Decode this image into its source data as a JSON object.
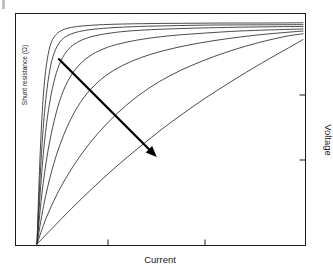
{
  "chart_data": {
    "type": "line",
    "title": "",
    "subtitle": "",
    "xlabel": "Current",
    "ylabel": "Voltage",
    "ylabel_secondary": "Shunt resistance (Ω)",
    "xlabel_position": "bottom-center",
    "ylabel_position": "right-rotated",
    "ylabel_secondary_position": "left-inside-rotated",
    "grid": false,
    "legend": false,
    "legend_position": "none",
    "xlim": [
      0,
      1
    ],
    "ylim": [
      0,
      1
    ],
    "x_tick_labels": [],
    "y_tick_labels": [],
    "x_tick_positions": [
      0.32,
      0.63
    ],
    "y_tick_positions": [
      0.35,
      0.65
    ],
    "series_count": 7,
    "series_description": "Family of current-voltage curves with decreasing shunt resistance; all curves share a common origin and saturate toward the upper right.",
    "annotation": {
      "type": "arrow",
      "label": "",
      "meaning": "decreasing shunt resistance",
      "from": [
        0.08,
        0.81
      ],
      "to": [
        0.45,
        0.38
      ]
    },
    "series": [
      {
        "name": "Rsh 1 (highest)",
        "knee_x": 0.055,
        "plateau_y": 0.965,
        "points": [
          [
            0.0,
            0.0
          ],
          [
            0.01,
            0.34
          ],
          [
            0.02,
            0.58
          ],
          [
            0.03,
            0.73
          ],
          [
            0.042,
            0.828
          ],
          [
            0.055,
            0.884
          ],
          [
            0.072,
            0.915
          ],
          [
            0.095,
            0.934
          ],
          [
            0.13,
            0.946
          ],
          [
            0.18,
            0.953
          ],
          [
            0.25,
            0.958
          ],
          [
            0.34,
            0.961
          ],
          [
            0.45,
            0.963
          ],
          [
            0.58,
            0.964
          ],
          [
            0.72,
            0.965
          ],
          [
            0.86,
            0.965
          ],
          [
            1.0,
            0.966
          ]
        ]
      },
      {
        "name": "Rsh 2",
        "knee_x": 0.075,
        "plateau_y": 0.958,
        "points": [
          [
            0.0,
            0.0
          ],
          [
            0.012,
            0.3
          ],
          [
            0.025,
            0.53
          ],
          [
            0.038,
            0.68
          ],
          [
            0.052,
            0.782
          ],
          [
            0.07,
            0.85
          ],
          [
            0.092,
            0.89
          ],
          [
            0.12,
            0.913
          ],
          [
            0.16,
            0.928
          ],
          [
            0.215,
            0.938
          ],
          [
            0.29,
            0.945
          ],
          [
            0.385,
            0.95
          ],
          [
            0.5,
            0.953
          ],
          [
            0.64,
            0.956
          ],
          [
            0.8,
            0.957
          ],
          [
            1.0,
            0.958
          ]
        ]
      },
      {
        "name": "Rsh 3",
        "knee_x": 0.1,
        "plateau_y": 0.95,
        "points": [
          [
            0.0,
            0.0
          ],
          [
            0.014,
            0.255
          ],
          [
            0.03,
            0.465
          ],
          [
            0.048,
            0.62
          ],
          [
            0.068,
            0.728
          ],
          [
            0.09,
            0.8
          ],
          [
            0.118,
            0.85
          ],
          [
            0.152,
            0.881
          ],
          [
            0.198,
            0.903
          ],
          [
            0.258,
            0.918
          ],
          [
            0.335,
            0.929
          ],
          [
            0.43,
            0.936
          ],
          [
            0.545,
            0.941
          ],
          [
            0.68,
            0.945
          ],
          [
            0.835,
            0.948
          ],
          [
            1.0,
            0.95
          ]
        ]
      },
      {
        "name": "Rsh 4",
        "knee_x": 0.14,
        "plateau_y": 0.94,
        "points": [
          [
            0.0,
            0.0
          ],
          [
            0.018,
            0.215
          ],
          [
            0.04,
            0.398
          ],
          [
            0.065,
            0.54
          ],
          [
            0.092,
            0.648
          ],
          [
            0.124,
            0.728
          ],
          [
            0.162,
            0.786
          ],
          [
            0.208,
            0.828
          ],
          [
            0.265,
            0.859
          ],
          [
            0.335,
            0.881
          ],
          [
            0.418,
            0.898
          ],
          [
            0.515,
            0.911
          ],
          [
            0.63,
            0.921
          ],
          [
            0.76,
            0.93
          ],
          [
            0.88,
            0.935
          ],
          [
            1.0,
            0.939
          ]
        ]
      },
      {
        "name": "Rsh 5",
        "knee_x": 0.2,
        "plateau_y": 0.93,
        "points": [
          [
            0.0,
            0.0
          ],
          [
            0.025,
            0.168
          ],
          [
            0.055,
            0.318
          ],
          [
            0.09,
            0.445
          ],
          [
            0.13,
            0.552
          ],
          [
            0.175,
            0.638
          ],
          [
            0.228,
            0.706
          ],
          [
            0.288,
            0.758
          ],
          [
            0.356,
            0.798
          ],
          [
            0.432,
            0.83
          ],
          [
            0.518,
            0.856
          ],
          [
            0.612,
            0.878
          ],
          [
            0.712,
            0.896
          ],
          [
            0.815,
            0.911
          ],
          [
            0.915,
            0.922
          ],
          [
            1.0,
            0.93
          ]
        ]
      },
      {
        "name": "Rsh 6",
        "knee_x": 0.33,
        "plateau_y": 0.918,
        "points": [
          [
            0.0,
            0.0
          ],
          [
            0.035,
            0.115
          ],
          [
            0.08,
            0.228
          ],
          [
            0.135,
            0.338
          ],
          [
            0.198,
            0.44
          ],
          [
            0.268,
            0.532
          ],
          [
            0.342,
            0.612
          ],
          [
            0.42,
            0.68
          ],
          [
            0.5,
            0.735
          ],
          [
            0.582,
            0.78
          ],
          [
            0.664,
            0.818
          ],
          [
            0.745,
            0.85
          ],
          [
            0.822,
            0.876
          ],
          [
            0.892,
            0.896
          ],
          [
            0.95,
            0.91
          ],
          [
            1.0,
            0.918
          ]
        ]
      },
      {
        "name": "Rsh 7 (lowest)",
        "knee_x": 0.62,
        "plateau_y": 0.893,
        "points": [
          [
            0.0,
            0.0
          ],
          [
            0.06,
            0.072
          ],
          [
            0.13,
            0.155
          ],
          [
            0.21,
            0.245
          ],
          [
            0.295,
            0.335
          ],
          [
            0.382,
            0.42
          ],
          [
            0.468,
            0.5
          ],
          [
            0.552,
            0.572
          ],
          [
            0.634,
            0.638
          ],
          [
            0.712,
            0.696
          ],
          [
            0.784,
            0.748
          ],
          [
            0.848,
            0.792
          ],
          [
            0.902,
            0.828
          ],
          [
            0.945,
            0.856
          ],
          [
            0.978,
            0.878
          ],
          [
            1.0,
            0.893
          ]
        ]
      }
    ]
  },
  "style": {
    "frame_color": "#1a1a1a",
    "curve_color": "#2b2b2b",
    "arrow_color": "#000000",
    "background": "#ffffff"
  }
}
